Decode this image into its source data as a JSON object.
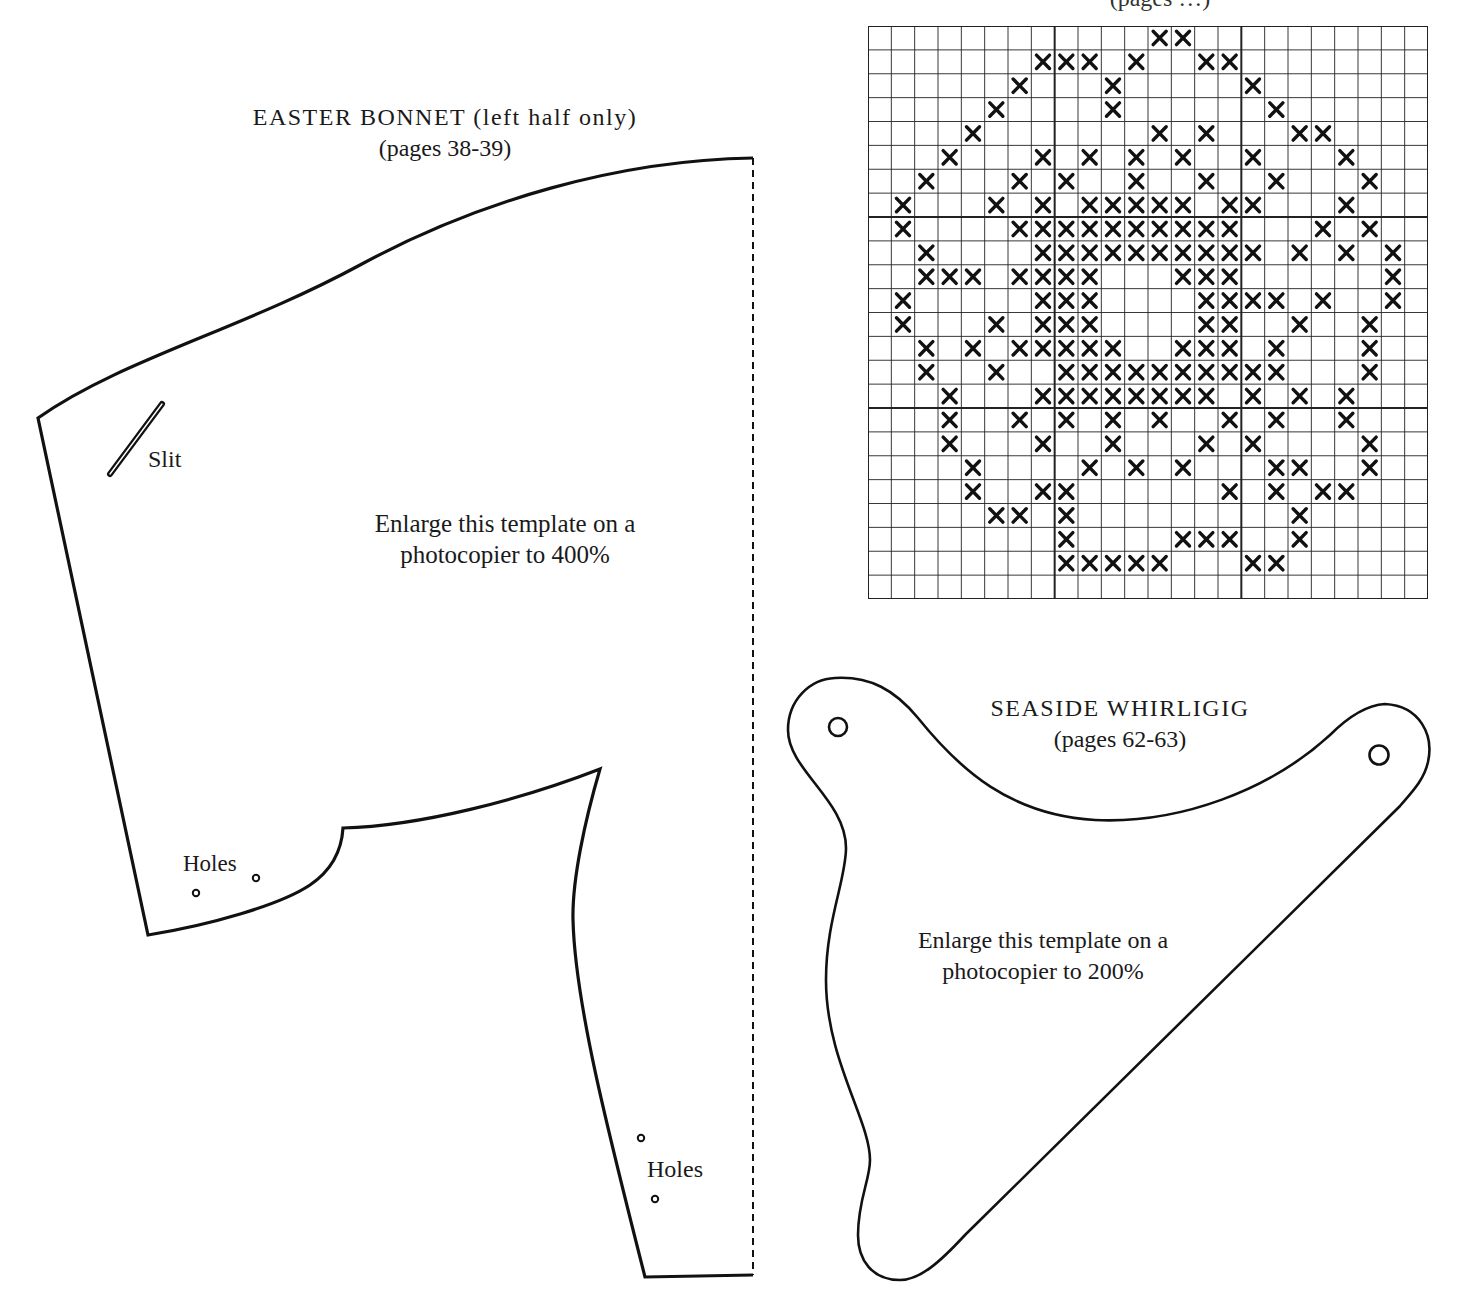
{
  "page": {
    "background": "#ffffff",
    "ink": "#111111"
  },
  "cross_stitch_chart": {
    "title_fragment": "(pages …)",
    "columns": 24,
    "rows": 24,
    "major_divisions_every": 8,
    "stitch_symbol": "✕",
    "stitches_by_row": [
      [
        12,
        13
      ],
      [
        7,
        8,
        9,
        11,
        14,
        15
      ],
      [
        6,
        10,
        16
      ],
      [
        5,
        10,
        17
      ],
      [
        4,
        12,
        14,
        18,
        19
      ],
      [
        3,
        7,
        9,
        11,
        13,
        16,
        20
      ],
      [
        2,
        6,
        8,
        11,
        14,
        17,
        21
      ],
      [
        1,
        5,
        7,
        9,
        10,
        11,
        12,
        13,
        15,
        16,
        20
      ],
      [
        1,
        6,
        7,
        8,
        9,
        10,
        11,
        12,
        13,
        14,
        15,
        19,
        21
      ],
      [
        2,
        7,
        8,
        9,
        10,
        11,
        12,
        13,
        14,
        15,
        16,
        18,
        20,
        22
      ],
      [
        2,
        3,
        4,
        6,
        7,
        8,
        9,
        13,
        14,
        15,
        22
      ],
      [
        1,
        7,
        8,
        9,
        14,
        15,
        16,
        17,
        19,
        22
      ],
      [
        1,
        5,
        7,
        8,
        9,
        14,
        15,
        18,
        21
      ],
      [
        2,
        4,
        6,
        7,
        8,
        9,
        10,
        13,
        14,
        15,
        17,
        21
      ],
      [
        2,
        5,
        8,
        9,
        10,
        11,
        12,
        13,
        14,
        15,
        16,
        17,
        21
      ],
      [
        3,
        7,
        8,
        9,
        10,
        11,
        12,
        13,
        14,
        16,
        18,
        20
      ],
      [
        3,
        6,
        8,
        10,
        12,
        15,
        17,
        20
      ],
      [
        3,
        7,
        10,
        14,
        16,
        21
      ],
      [
        4,
        9,
        11,
        13,
        17,
        18,
        21
      ],
      [
        4,
        7,
        8,
        15,
        17,
        19,
        20
      ],
      [
        5,
        6,
        8,
        18
      ],
      [
        8,
        13,
        14,
        15,
        18
      ],
      [
        8,
        9,
        10,
        11,
        12,
        16,
        17
      ],
      []
    ]
  },
  "easter_bonnet": {
    "title": "EASTER BONNET (left half only)",
    "pages": "(pages 38-39)",
    "instruction_line1": "Enlarge this template on a",
    "instruction_line2": "photocopier to 400%",
    "slit_label": "Slit",
    "holes_label_upper": "Holes",
    "holes_label_lower": "Holes",
    "fold_line": "dashed"
  },
  "seaside_whirligig": {
    "title": "SEASIDE WHIRLIGIG",
    "pages": "(pages 62-63)",
    "instruction_line1": "Enlarge this template on a",
    "instruction_line2": "photocopier to 200%"
  }
}
